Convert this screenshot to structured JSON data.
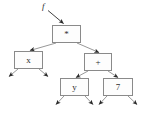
{
  "diagram": {
    "kind": "binary-expression-tree",
    "title": "",
    "pointer_label": "f",
    "stroke_color": "#8a8a8a",
    "text_color": "#2e2e2e",
    "background_color": "#ffffff",
    "nodes": [
      {
        "id": "root",
        "label": "*",
        "x": 52,
        "y": 25,
        "w": 29,
        "h": 18
      },
      {
        "id": "left",
        "label": "x",
        "x": 14,
        "y": 51,
        "w": 29,
        "h": 18
      },
      {
        "id": "right",
        "label": "+",
        "x": 84,
        "y": 53,
        "w": 28,
        "h": 18
      },
      {
        "id": "rleft",
        "label": "y",
        "x": 60,
        "y": 78,
        "w": 29,
        "h": 18
      },
      {
        "id": "rright",
        "label": "7",
        "x": 103,
        "y": 78,
        "w": 30,
        "h": 18
      }
    ],
    "edges": [
      {
        "from": "root",
        "to": "left"
      },
      {
        "from": "root",
        "to": "right"
      },
      {
        "from": "right",
        "to": "rleft"
      },
      {
        "from": "right",
        "to": "rright"
      }
    ],
    "null_pointers": 6,
    "pointer_arrow": {
      "from_x": 48,
      "from_y": 10,
      "to_x": 64,
      "to_y": 24
    }
  }
}
